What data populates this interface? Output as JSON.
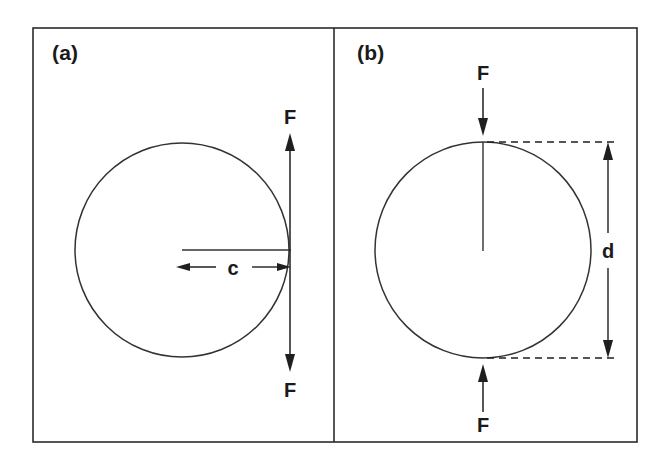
{
  "figure": {
    "domain": "Diagram",
    "background_color": "#ffffff",
    "ink_color": "#1f1f1f",
    "outline_color": "#333333",
    "frame": {
      "x": 33,
      "y": 28,
      "width": 604,
      "height": 414,
      "divider_x": 334
    }
  },
  "panels": [
    {
      "id": "panel-a",
      "label": "(a)",
      "label_x": 52,
      "label_y": 60,
      "loading_mode": "tensile",
      "specimen": {
        "shape": "circle",
        "center_x": 182,
        "center_y": 250,
        "radius": 107
      },
      "crack": {
        "orientation": "horizontal",
        "from_x": 182,
        "from_y": 250,
        "to_x": 290,
        "to_y": 250,
        "dimension_label": "c"
      },
      "dimension": {
        "name": "c",
        "label": "c",
        "label_x": 233,
        "label_y": 275,
        "axis": "horizontal",
        "line_y": 267,
        "from_x": 176,
        "to_x": 290,
        "double_headed": true
      },
      "forces": [
        {
          "id": "force-top-a",
          "label": "F",
          "label_x": 290,
          "label_y": 124,
          "direction": "up",
          "tail_x": 290,
          "tail_y": 250,
          "head_x": 290,
          "head_y": 135
        },
        {
          "id": "force-bottom-a",
          "label": "F",
          "label_x": 290,
          "label_y": 397,
          "direction": "down",
          "tail_x": 290,
          "tail_y": 250,
          "head_x": 290,
          "head_y": 370
        }
      ]
    },
    {
      "id": "panel-b",
      "label": "(b)",
      "label_x": 357,
      "label_y": 60,
      "loading_mode": "compressive",
      "specimen": {
        "shape": "circle",
        "center_x": 483,
        "center_y": 250,
        "radius": 108
      },
      "crack": {
        "orientation": "vertical",
        "from_x": 483,
        "from_y": 142,
        "to_x": 483,
        "to_y": 250,
        "dimension_label": "d"
      },
      "dimension": {
        "name": "d",
        "label": "d",
        "label_x": 608,
        "label_y": 258,
        "axis": "vertical",
        "line_x": 608,
        "from_y": 142,
        "to_y": 358,
        "double_headed": true,
        "leaders": [
          {
            "id": "leader-top",
            "x1": 483,
            "y1": 142,
            "x2": 614,
            "y2": 142
          },
          {
            "id": "leader-bottom",
            "x1": 483,
            "y1": 358,
            "x2": 614,
            "y2": 358
          }
        ]
      },
      "forces": [
        {
          "id": "force-top-b",
          "label": "F",
          "label_x": 483,
          "label_y": 80,
          "direction": "down",
          "tail_x": 483,
          "tail_y": 88,
          "head_x": 483,
          "head_y": 134
        },
        {
          "id": "force-bottom-b",
          "label": "F",
          "label_x": 483,
          "label_y": 432,
          "direction": "up",
          "tail_x": 483,
          "tail_y": 412,
          "head_x": 483,
          "head_y": 366
        }
      ]
    }
  ]
}
